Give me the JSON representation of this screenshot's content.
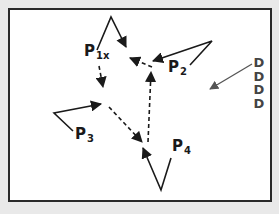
{
  "diagram": {
    "labels": {
      "p1": {
        "main": "P",
        "sub": "1x"
      },
      "p2": {
        "main": "P",
        "sub": "2"
      },
      "p3": {
        "main": "P",
        "sub": "3"
      },
      "p4": {
        "main": "P",
        "sub": "4"
      }
    },
    "d_column": [
      "D",
      "D",
      "D",
      "D"
    ],
    "colors": {
      "background": "#e9e9e9",
      "panel": "#ffffff",
      "border": "#2a2a2a",
      "line": "#1a1a1a",
      "gray_arrow": "#555555"
    },
    "arrows": {
      "solid": [
        {
          "from": "P1x",
          "path": "up-then-down",
          "to": "near P2 dashed junction"
        },
        {
          "from": "P2",
          "path": "angle-left",
          "to": "P1 dashed junction"
        },
        {
          "from": "P3",
          "path": "angle-right",
          "to": "dashed junction left"
        },
        {
          "from": "P4",
          "path": "angle-up-left",
          "to": "bottom junction"
        }
      ],
      "dashed": [
        {
          "from": "P2 junction",
          "to": "P1 junction"
        },
        {
          "from": "P1x",
          "to": "left junction"
        },
        {
          "from": "left junction",
          "to": "bottom junction"
        },
        {
          "from": "bottom junction",
          "to": "P2 junction"
        }
      ],
      "gray": [
        {
          "from": "D column",
          "to": "open area"
        }
      ]
    }
  }
}
